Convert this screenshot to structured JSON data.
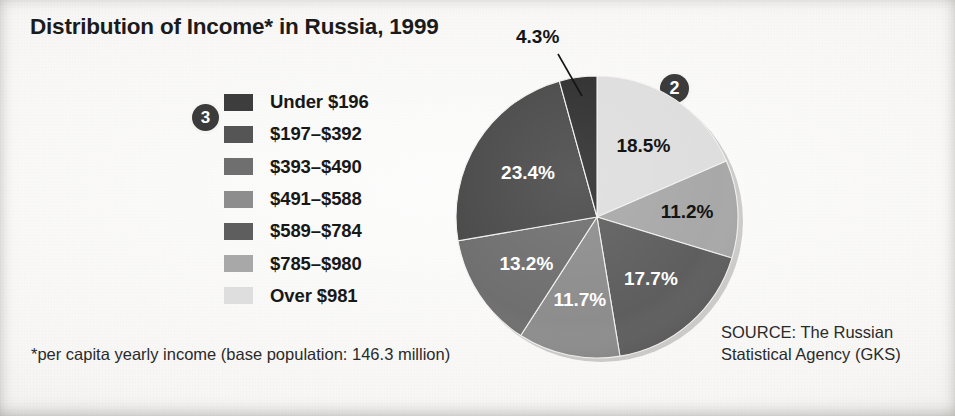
{
  "title": "Distribution of Income* in Russia, 1999",
  "footnote": "*per capita yearly income (base population: 146.3 million)",
  "source": {
    "line1": "SOURCE: The Russian",
    "line2": "Statistical Agency (GKS)"
  },
  "badges": {
    "legend_step": "3",
    "pie_step": "2"
  },
  "callout": {
    "label": "4.3%"
  },
  "colors": {
    "background": "#f3f2f0",
    "title_text": "#1b1b1b",
    "badge_fill": "#3b3b3b",
    "badge_text": "#ffffff",
    "label_dark": "#141414",
    "label_light": "#ffffff"
  },
  "legend": {
    "items": [
      {
        "label": "Under $196",
        "color": "#3d3d3d"
      },
      {
        "label": "$197–$392",
        "color": "#555555"
      },
      {
        "label": "$393–$490",
        "color": "#6f6f6f"
      },
      {
        "label": "$491–$588",
        "color": "#8d8d8d"
      },
      {
        "label": "$589–$784",
        "color": "#5e5e5e"
      },
      {
        "label": "$785–$980",
        "color": "#a8a8a8"
      },
      {
        "label": "Over $981",
        "color": "#dedede"
      }
    ]
  },
  "chart_data": {
    "type": "pie",
    "title": "Distribution of Income* in Russia, 1999",
    "unit": "percent",
    "start_angle_deg": 0,
    "direction": "clockwise",
    "categories": [
      "Over $981",
      "$785–$980",
      "$589–$784",
      "$491–$588",
      "$393–$490",
      "$197–$392",
      "Under $196"
    ],
    "values": [
      18.5,
      11.2,
      17.7,
      11.7,
      13.2,
      23.4,
      4.3
    ],
    "labels": [
      "18.5%",
      "11.2%",
      "17.7%",
      "11.7%",
      "13.2%",
      "23.4%",
      "4.3%"
    ],
    "colors": [
      "#dedede",
      "#a8a8a8",
      "#5e5e5e",
      "#8d8d8d",
      "#6f6f6f",
      "#4a4a4a",
      "#2f2f2f"
    ],
    "label_styles": [
      "dark",
      "dark",
      "light",
      "light",
      "light",
      "light",
      "callout"
    ],
    "legend_position": "left",
    "grid": false
  }
}
